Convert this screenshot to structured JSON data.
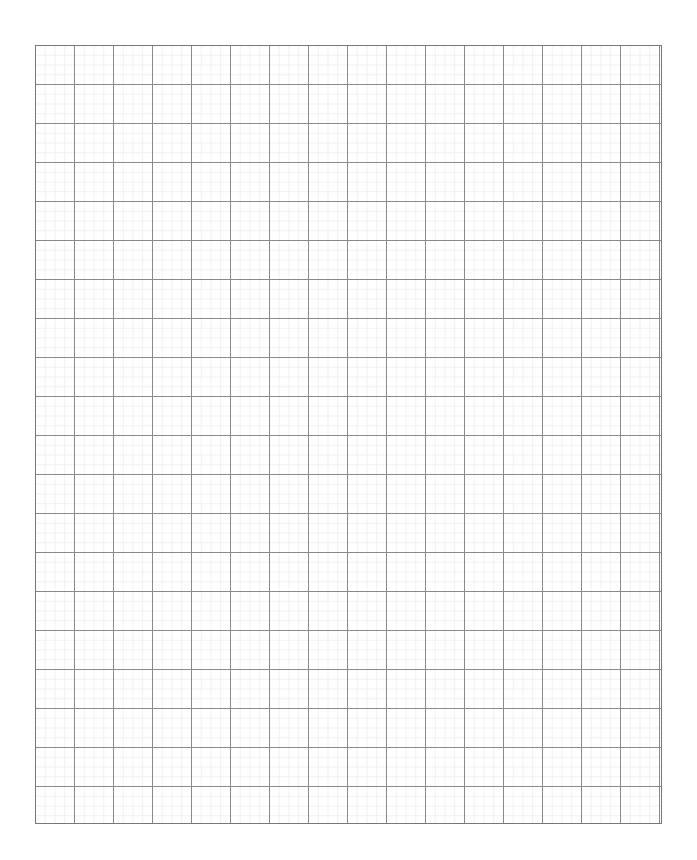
{
  "page": {
    "background_color": "#ffffff",
    "width_px": 697,
    "height_px": 860
  },
  "grid": {
    "name": "graph-paper-grid",
    "left_px": 35,
    "top_px": 45,
    "width_px": 627,
    "height_px": 779,
    "major_columns": 16,
    "major_rows": 20,
    "major_cell_size_px": 39,
    "minor_per_major": 4,
    "minor_cell_size_px": 9.75,
    "major_line_color": "#8a8a8a",
    "minor_line_color": "#f1f1f1",
    "border_color": "#777777",
    "major_line_width_px": 1,
    "minor_line_width_px": 1,
    "border_width_px": 1,
    "cell_fill_color": "#ffffff"
  },
  "chart_data": {
    "type": "table",
    "title": "",
    "xlabel": "",
    "ylabel": "",
    "categories": [],
    "values": [],
    "grid": true,
    "legend": "none"
  }
}
